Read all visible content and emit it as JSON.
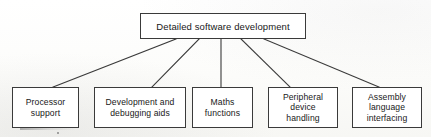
{
  "diagram": {
    "type": "tree",
    "orientation": "top-down",
    "background_color": "#fdfdfb",
    "line_color": "#3a3a3a",
    "box_fill_color": "#ffffff",
    "text_color": "#181818",
    "root": {
      "id": "detailed-software-development",
      "label": "Detailed software development"
    },
    "children": [
      {
        "id": "processor-support",
        "label": "Processor\nsupport"
      },
      {
        "id": "development-and-debugging-aids",
        "label": "Development and\ndebugging aids"
      },
      {
        "id": "maths-functions",
        "label": "Maths\nfunctions"
      },
      {
        "id": "peripheral-device-handling",
        "label": "Peripheral\ndevice\nhandling"
      },
      {
        "id": "assembly-language-interfacing",
        "label": "Assembly\nlanguage\ninterfacing"
      }
    ],
    "connectors": [
      {
        "from": "detailed-software-development",
        "to": "processor-support",
        "x1": 176,
        "y1": 39,
        "x2": 53,
        "y2": 87
      },
      {
        "from": "detailed-software-development",
        "to": "development-and-debugging-aids",
        "x1": 199,
        "y1": 39,
        "x2": 152,
        "y2": 87
      },
      {
        "from": "detailed-software-development",
        "to": "maths-functions",
        "x1": 221,
        "y1": 39,
        "x2": 221,
        "y2": 87
      },
      {
        "from": "detailed-software-development",
        "to": "peripheral-device-handling",
        "x1": 241,
        "y1": 39,
        "x2": 290,
        "y2": 87
      },
      {
        "from": "detailed-software-development",
        "to": "assembly-language-interfacing",
        "x1": 264,
        "y1": 39,
        "x2": 379,
        "y2": 87
      }
    ]
  }
}
